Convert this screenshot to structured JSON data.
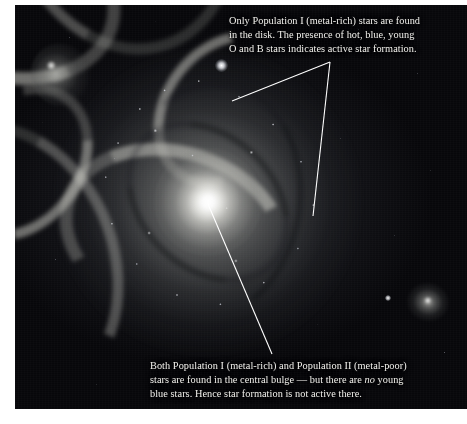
{
  "figure": {
    "plate": {
      "objects": [
        {
          "name": "main-spiral-galaxy",
          "role": "face-on spiral galaxy with bright central bulge and blue-knotted spiral arms"
        },
        {
          "name": "companion-galaxy-upper-left",
          "role": "small irregular companion galaxy near top-left corner"
        },
        {
          "name": "companion-galaxy-right",
          "role": "small background spiral galaxy near right edge"
        },
        {
          "name": "foreground-star",
          "role": "bright foreground field star"
        }
      ],
      "background_color": "#07070a",
      "text_color": "#f3f2ee",
      "leader_line_color": "#ffffff"
    }
  },
  "annotations": {
    "disk": {
      "id": "disk-annotation",
      "target": "spiral-arms / disk",
      "lines": [
        "Only Population I (metal-rich) stars are found",
        "in the disk. The presence of hot, blue, young",
        "O and B stars indicates active star formation."
      ],
      "leader_count": 2
    },
    "bulge": {
      "id": "bulge-annotation",
      "target": "central bulge / nucleus",
      "lines": [
        "Both Population I (metal-rich) and Population II (metal-poor)",
        "stars are found in the central bulge — but there are no young",
        "blue stars. Hence star formation is not active there."
      ],
      "italic_word": "no",
      "leader_count": 1
    }
  }
}
